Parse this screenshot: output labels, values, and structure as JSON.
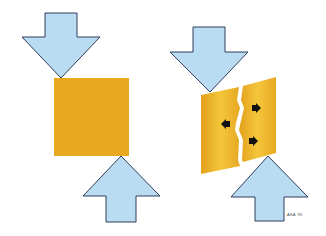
{
  "diagram": {
    "panels": [
      {
        "name": "intact-block",
        "description": "Square under compression"
      },
      {
        "name": "fractured-block",
        "description": "Block split by crack with displacement arrows"
      }
    ],
    "credit": "ASA '95",
    "colors": {
      "arrow_fill": "#b9dcf2",
      "arrow_stroke": "#2f3c5a",
      "block": "#e8a921",
      "block_light": "#f2c437",
      "crack": "#ffffff",
      "small_arrow": "#111111"
    }
  }
}
